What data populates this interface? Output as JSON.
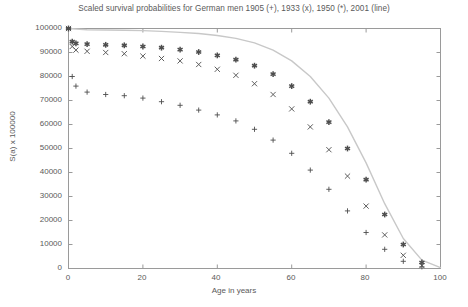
{
  "chart_data": {
    "type": "scatter",
    "title": "Scaled survival probabilities for German men 1905 (+), 1933 (x), 1950 (*), 2001 (line)",
    "xlabel": "Age in years",
    "ylabel": "S(a) x 100000",
    "xlim": [
      0,
      100
    ],
    "ylim": [
      0,
      100000
    ],
    "xticks": [
      0,
      20,
      40,
      60,
      80,
      100
    ],
    "yticks": [
      0,
      10000,
      20000,
      30000,
      40000,
      50000,
      60000,
      70000,
      80000,
      90000,
      100000
    ],
    "grid": false,
    "legend_position": "in-title",
    "series": [
      {
        "name": "1905",
        "marker": "+",
        "x": [
          0,
          1,
          2,
          5,
          10,
          15,
          20,
          25,
          30,
          35,
          40,
          45,
          50,
          55,
          60,
          65,
          70,
          75,
          80,
          85,
          90,
          95
        ],
        "y": [
          100000,
          80000,
          76000,
          73500,
          72500,
          72000,
          71000,
          69500,
          68000,
          66000,
          64000,
          61500,
          58000,
          53500,
          48000,
          41000,
          33000,
          24000,
          15000,
          8000,
          3000,
          700
        ]
      },
      {
        "name": "1933",
        "marker": "x",
        "x": [
          0,
          1,
          2,
          5,
          10,
          15,
          20,
          25,
          30,
          35,
          40,
          45,
          50,
          55,
          60,
          65,
          70,
          75,
          80,
          85,
          90,
          95
        ],
        "y": [
          100000,
          92500,
          91000,
          90500,
          90000,
          89500,
          88500,
          87500,
          86500,
          85000,
          83000,
          80500,
          77000,
          72500,
          66500,
          59000,
          49500,
          38500,
          26000,
          14000,
          5500,
          1200
        ]
      },
      {
        "name": "1950",
        "marker": "*",
        "x": [
          0,
          1,
          2,
          5,
          10,
          15,
          20,
          25,
          30,
          35,
          40,
          45,
          50,
          55,
          60,
          65,
          70,
          75,
          80,
          85,
          90,
          95
        ],
        "y": [
          100000,
          94500,
          93800,
          93500,
          93200,
          93000,
          92500,
          92000,
          91200,
          90200,
          88800,
          87000,
          84500,
          81000,
          76000,
          69500,
          61000,
          50000,
          37000,
          22500,
          10000,
          2500
        ]
      },
      {
        "name": "2001",
        "marker": "line",
        "x": [
          0,
          5,
          10,
          15,
          20,
          25,
          30,
          35,
          40,
          45,
          50,
          55,
          60,
          65,
          70,
          75,
          80,
          85,
          90,
          95,
          100
        ],
        "y": [
          100000,
          99500,
          99400,
          99300,
          99100,
          98800,
          98400,
          97900,
          97100,
          95900,
          94000,
          91000,
          86500,
          80000,
          71000,
          59000,
          44000,
          27000,
          12500,
          3500,
          400
        ]
      }
    ]
  },
  "axis": {
    "ytick_labels": [
      "100000",
      "90000",
      "80000",
      "70000",
      "60000",
      "50000",
      "40000",
      "30000",
      "20000",
      "10000",
      "0"
    ],
    "xtick_labels": [
      "0",
      "20",
      "40",
      "60",
      "80",
      "100"
    ]
  }
}
